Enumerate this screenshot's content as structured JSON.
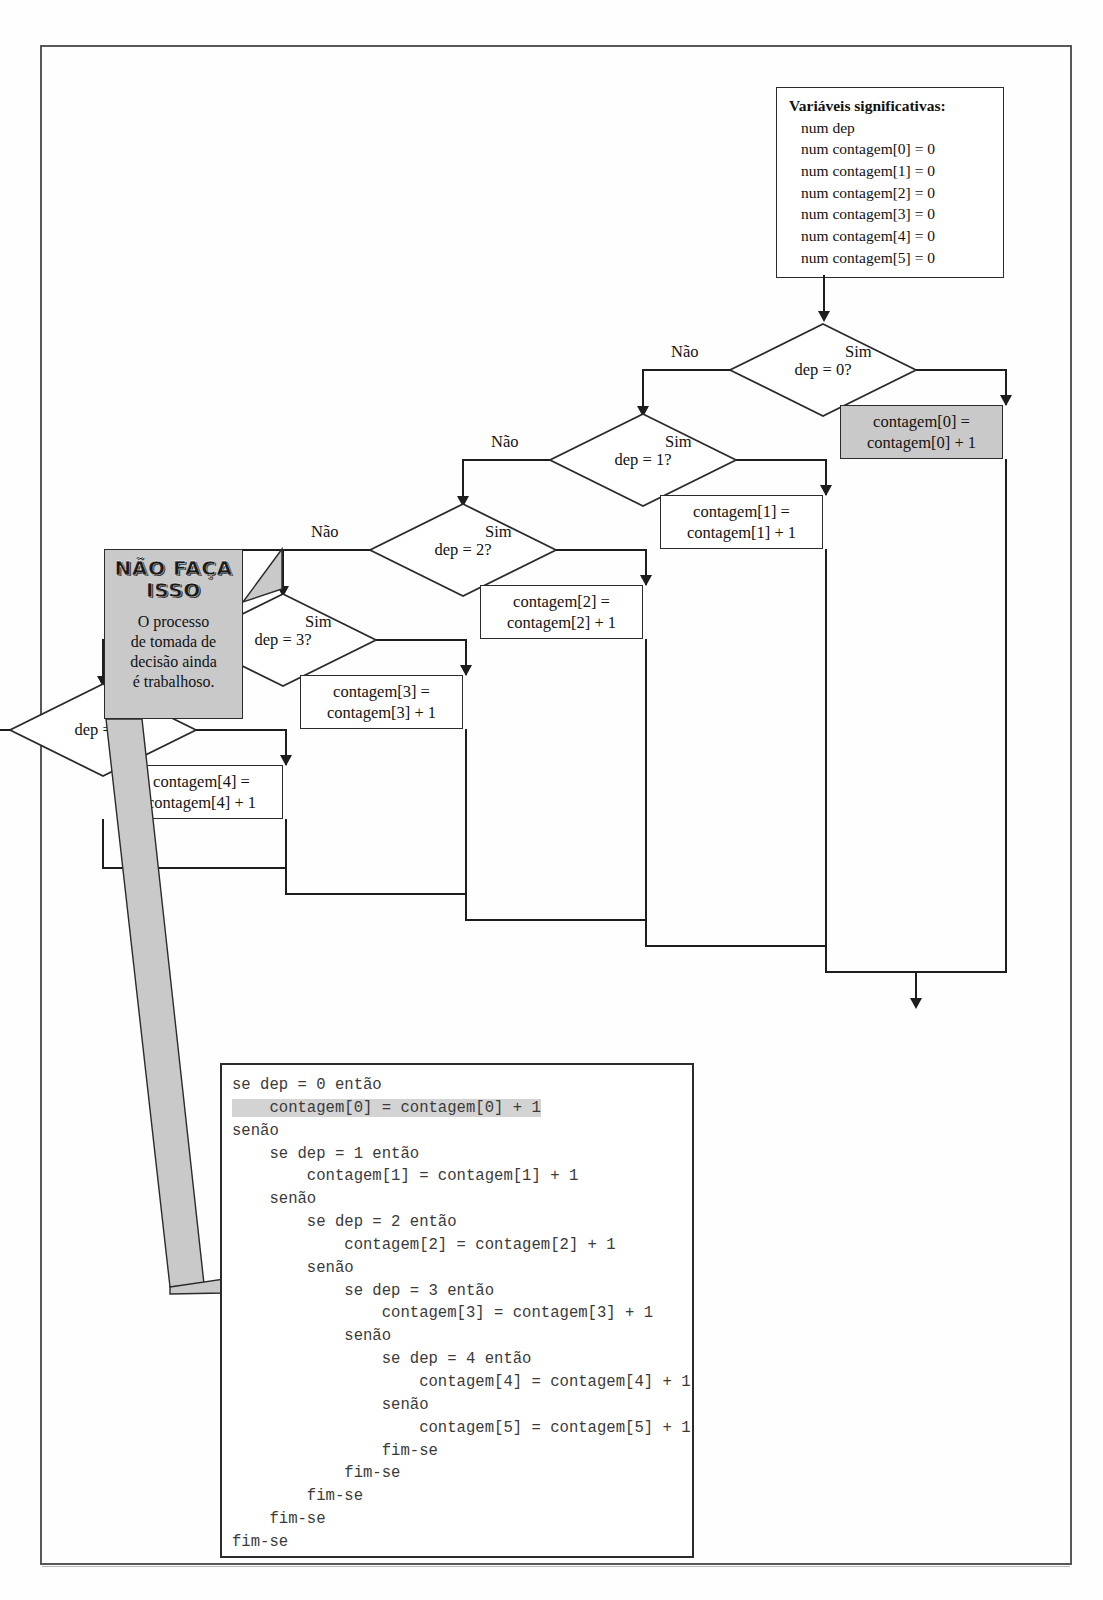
{
  "figure": {
    "variables_box": {
      "heading": "Variáveis significativas:",
      "lines": [
        "num dep",
        "num contagem[0] = 0",
        "num contagem[1] = 0",
        "num contagem[2] = 0",
        "num contagem[3] = 0",
        "num contagem[4] = 0",
        "num contagem[5] = 0"
      ]
    },
    "decisions": [
      {
        "text": "dep = 0?",
        "no_label": "Não",
        "yes_label": "Sim"
      },
      {
        "text": "dep = 1?",
        "no_label": "Não",
        "yes_label": "Sim"
      },
      {
        "text": "dep = 2?",
        "no_label": "Não",
        "yes_label": "Sim"
      },
      {
        "text": "dep = 3?",
        "no_label": "Não",
        "yes_label": "Sim"
      },
      {
        "text": "dep = 4?",
        "no_label": "Não",
        "yes_label": "Sim"
      }
    ],
    "process_boxes": [
      {
        "line1": "contagem[0] =",
        "line2": "contagem[0] + 1",
        "shaded": true
      },
      {
        "line1": "contagem[1] =",
        "line2": "contagem[1] + 1",
        "shaded": false
      },
      {
        "line1": "contagem[2] =",
        "line2": "contagem[2] + 1",
        "shaded": false
      },
      {
        "line1": "contagem[3] =",
        "line2": "contagem[3] + 1",
        "shaded": false
      },
      {
        "line1": "contagem[4] =",
        "line2": "contagem[4] + 1",
        "shaded": false
      },
      {
        "line1": "contagem[5] =",
        "line2": "contagem[5] + 1",
        "shaded": false
      }
    ],
    "callout": {
      "title_line1": "NÃO FAÇA",
      "title_line2": "ISSO",
      "body_line1": "O processo",
      "body_line2": "de tomada de",
      "body_line3": "decisão ainda",
      "body_line4": "é trabalhoso."
    },
    "code": {
      "before_highlight": "se dep = 0 então\n",
      "highlight": "    contagem[0] = contagem[0] + 1",
      "after_highlight": "\nsenão\n    se dep = 1 então\n        contagem[1] = contagem[1] + 1\n    senão\n        se dep = 2 então\n            contagem[2] = contagem[2] + 1\n        senão\n            se dep = 3 então\n                contagem[3] = contagem[3] + 1\n            senão\n                se dep = 4 então\n                    contagem[4] = contagem[4] + 1\n                senão\n                    contagem[5] = contagem[5] + 1\n                fim-se\n            fim-se\n        fim-se\n    fim-se\nfim-se"
    },
    "caption": "",
    "colors": {
      "shade": "#c9c9c9",
      "line": "#1d1d1d",
      "border": "#2b2b2b",
      "code_highlight": "#d3d3d3"
    }
  }
}
